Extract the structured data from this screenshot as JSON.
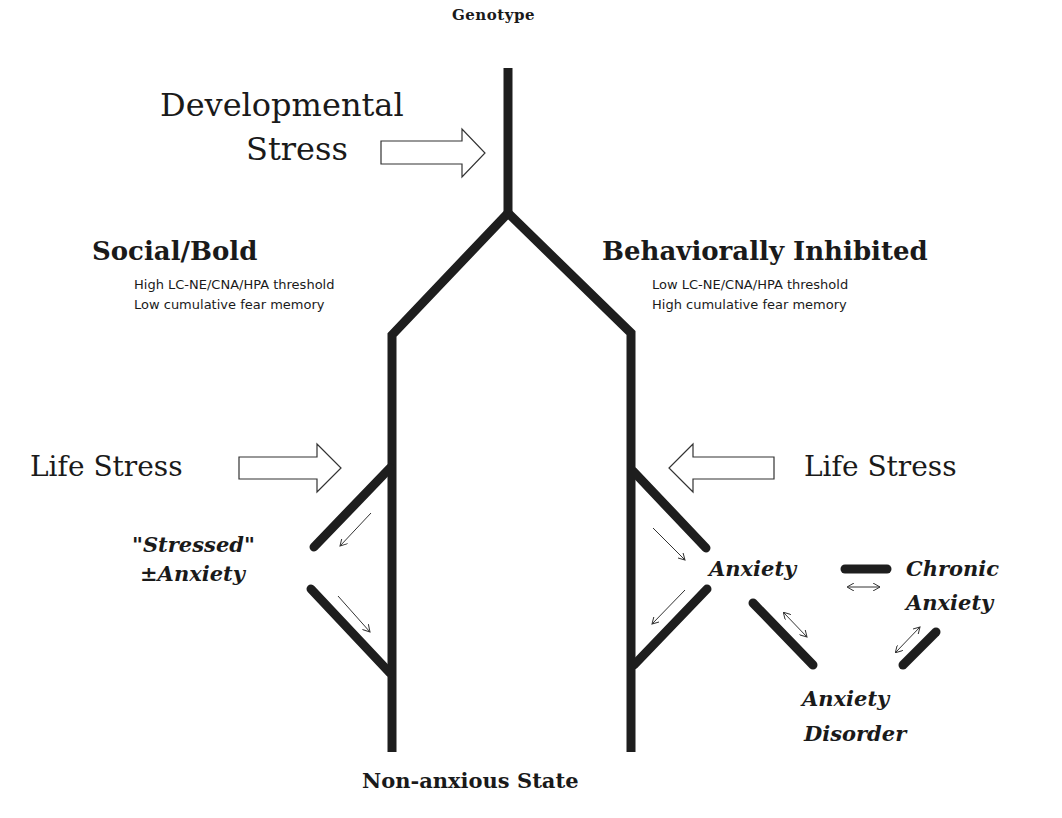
{
  "diagram": {
    "type": "developmental-pathway-tree",
    "root_label": "Genotype",
    "bottom_label": "Non-anxious State",
    "developmental_stress": {
      "line1": "Developmental",
      "line2": "Stress"
    },
    "left_branch": {
      "title": "Social/Bold",
      "line1": "High LC-NE/CNA/HPA threshold",
      "line2": "Low cumulative fear memory",
      "life_stress": "Life Stress",
      "state_line1": "\"Stressed\"",
      "state_line2": "±Anxiety"
    },
    "right_branch": {
      "title": "Behaviorally Inhibited",
      "line1": "Low LC-NE/CNA/HPA threshold",
      "line2": "High cumulative fear memory",
      "life_stress": "Life Stress",
      "anxiety": "Anxiety",
      "chronic_line1": "Chronic",
      "chronic_line2": "Anxiety",
      "disorder_line1": "Anxiety",
      "disorder_line2": "Disorder"
    },
    "colors": {
      "line": "#1e1e1e",
      "text": "#1a1a1a",
      "background": "#ffffff"
    }
  }
}
